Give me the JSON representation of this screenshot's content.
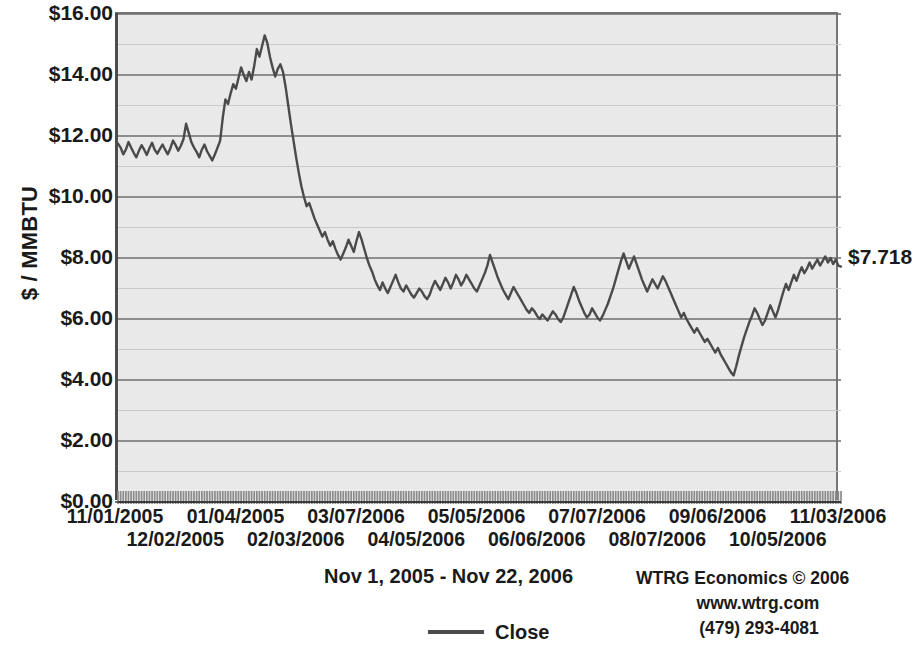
{
  "chart_data": {
    "type": "line",
    "title": "",
    "subtitle": "Nov 1, 2005 - Nov 22, 2006",
    "xlabel": "",
    "ylabel": "$ / MMBTU",
    "ylim": [
      0,
      16
    ],
    "y_major_step": 2,
    "y_minor_step": 1,
    "grid": true,
    "legend_position": "bottom",
    "last_value_label": "$7.718",
    "y_tick_labels": [
      "$16.00",
      "$14.00",
      "$12.00",
      "$10.00",
      "$8.00",
      "$6.00",
      "$4.00",
      "$2.00",
      "$0.00"
    ],
    "y_tick_values": [
      16,
      14,
      12,
      10,
      8,
      6,
      4,
      2,
      0
    ],
    "x_tick_labels": [
      "11/01/2005",
      "12/02/2005",
      "01/04/2005",
      "02/03/2006",
      "03/07/2006",
      "04/05/2006",
      "05/05/2006",
      "06/06/2006",
      "07/07/2006",
      "08/07/2006",
      "09/06/2006",
      "10/05/2006",
      "11/03/2006"
    ],
    "series": [
      {
        "name": "Close",
        "color": "#4a4a4a",
        "values": [
          11.75,
          11.62,
          11.4,
          11.55,
          11.8,
          11.62,
          11.45,
          11.3,
          11.52,
          11.7,
          11.55,
          11.38,
          11.6,
          11.78,
          11.55,
          11.42,
          11.58,
          11.72,
          11.55,
          11.4,
          11.6,
          11.85,
          11.7,
          11.52,
          11.68,
          11.9,
          12.4,
          12.1,
          11.8,
          11.62,
          11.48,
          11.3,
          11.55,
          11.72,
          11.5,
          11.35,
          11.2,
          11.4,
          11.62,
          11.85,
          12.6,
          13.2,
          13.05,
          13.4,
          13.7,
          13.55,
          13.9,
          14.25,
          14.0,
          13.8,
          14.1,
          13.85,
          14.3,
          14.85,
          14.6,
          14.95,
          15.3,
          15.05,
          14.6,
          14.25,
          13.95,
          14.2,
          14.35,
          14.1,
          13.6,
          13.0,
          12.4,
          11.85,
          11.3,
          10.8,
          10.35,
          10.0,
          9.7,
          9.8,
          9.55,
          9.3,
          9.1,
          8.9,
          8.7,
          8.85,
          8.6,
          8.4,
          8.55,
          8.3,
          8.1,
          7.95,
          8.15,
          8.35,
          8.6,
          8.4,
          8.2,
          8.55,
          8.85,
          8.6,
          8.3,
          8.0,
          7.75,
          7.55,
          7.3,
          7.1,
          6.95,
          7.2,
          7.0,
          6.85,
          7.05,
          7.25,
          7.45,
          7.2,
          7.0,
          6.9,
          7.1,
          6.95,
          6.8,
          6.7,
          6.85,
          7.0,
          6.9,
          6.75,
          6.65,
          6.8,
          7.05,
          7.25,
          7.1,
          6.95,
          7.15,
          7.35,
          7.2,
          7.0,
          7.2,
          7.45,
          7.3,
          7.1,
          7.25,
          7.45,
          7.3,
          7.15,
          7.0,
          6.9,
          7.1,
          7.3,
          7.5,
          7.75,
          8.1,
          7.85,
          7.6,
          7.35,
          7.15,
          6.95,
          6.8,
          6.65,
          6.85,
          7.05,
          6.9,
          6.75,
          6.6,
          6.45,
          6.3,
          6.2,
          6.35,
          6.25,
          6.1,
          6.0,
          6.15,
          6.05,
          5.95,
          6.1,
          6.25,
          6.15,
          6.0,
          5.9,
          6.05,
          6.3,
          6.55,
          6.8,
          7.05,
          6.85,
          6.6,
          6.4,
          6.2,
          6.05,
          6.15,
          6.35,
          6.2,
          6.05,
          5.95,
          6.1,
          6.3,
          6.5,
          6.75,
          7.0,
          7.3,
          7.6,
          7.9,
          8.15,
          7.9,
          7.65,
          7.85,
          8.05,
          7.8,
          7.55,
          7.3,
          7.1,
          6.9,
          7.1,
          7.3,
          7.15,
          7.0,
          7.2,
          7.4,
          7.25,
          7.05,
          6.85,
          6.65,
          6.45,
          6.25,
          6.05,
          6.2,
          6.0,
          5.85,
          5.7,
          5.55,
          5.7,
          5.55,
          5.4,
          5.25,
          5.35,
          5.2,
          5.05,
          4.9,
          5.05,
          4.85,
          4.7,
          4.55,
          4.4,
          4.25,
          4.15,
          4.45,
          4.8,
          5.1,
          5.4,
          5.65,
          5.9,
          6.1,
          6.35,
          6.2,
          6.0,
          5.8,
          5.95,
          6.2,
          6.45,
          6.25,
          6.05,
          6.3,
          6.6,
          6.9,
          7.15,
          6.95,
          7.2,
          7.45,
          7.25,
          7.5,
          7.7,
          7.5,
          7.65,
          7.85,
          7.65,
          7.8,
          7.95,
          7.75,
          7.9,
          8.05,
          7.85,
          8.0,
          7.8,
          7.95,
          7.75,
          7.718
        ]
      }
    ]
  },
  "legend": {
    "entries": [
      {
        "label": "Close"
      }
    ]
  },
  "footer": {
    "period": "Nov 1, 2005 - Nov 22, 2006",
    "credit_line1": "WTRG Economics © 2006",
    "credit_line2": "www.wtrg.com",
    "credit_line3": "(479) 293-4081"
  }
}
